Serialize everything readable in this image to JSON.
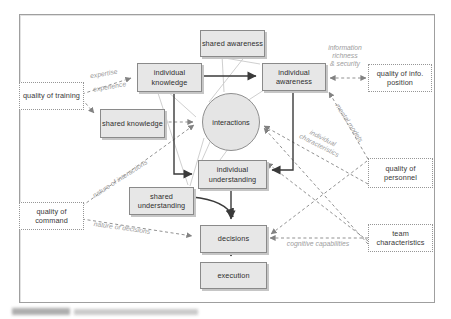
{
  "figure": {
    "type": "concept-diagram",
    "colors": {
      "node_fill": "#e7e7e7",
      "node_border": "#8a8a8a",
      "dashed_line": "#919191",
      "label_gray": "#9c9c9c",
      "solid_line": "#3a3a3a"
    }
  },
  "nodes": {
    "shared_awareness": "shared awareness",
    "individual_knowledge": "individual knowledge",
    "individual_awareness": "individual awareness",
    "shared_knowledge": "shared knowledge",
    "interactions": "interactions",
    "individual_understanding": "individual understanding",
    "shared_understanding": "shared understanding",
    "decisions": "decisions",
    "execution": "execution"
  },
  "factors": {
    "quality_of_training": "quality of training",
    "quality_of_command": "quality of command",
    "quality_of_info_position": "quality of info. position",
    "quality_of_personnel": "quality of personnel",
    "team_characteristics": "team characteristics"
  },
  "edge_labels": {
    "expertise": "expertise",
    "experience": "experience",
    "information": "information",
    "richness": "richness",
    "and_security": "& security",
    "mental_models": "mental models",
    "individual_word": "individual",
    "characteristics_word": "characteristics",
    "nature_of_interactions": "nature of interactions",
    "nature_of_decisions": "nature of decisions",
    "cognitive_capabilities": "cognitive capabilities"
  }
}
